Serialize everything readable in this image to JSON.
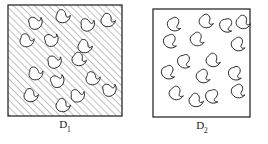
{
  "figure": {
    "type": "two-region-comparison-diagram",
    "background_color": "#ffffff",
    "stroke_color": "#1a1a1a",
    "hatch_color": "#8c8c8c",
    "bean_fill": "#ffffff",
    "bean_stroke": "#1a1a1a"
  },
  "panels": [
    {
      "id": "D1",
      "label_main": "D",
      "label_sub": "1",
      "box": {
        "x": 8,
        "y": 5,
        "width": 114,
        "height": 111
      },
      "label_pos": {
        "x": 65,
        "y": 125
      },
      "fill": "hatched",
      "hatch_angle_deg": 45,
      "hatch_spacing_px": 5,
      "shape_count": 16,
      "shapes": [
        {
          "cx": 36,
          "cy": 23,
          "r": 7.2,
          "rot": -20
        },
        {
          "cx": 63,
          "cy": 17,
          "r": 7.2,
          "rot": 15
        },
        {
          "cx": 88,
          "cy": 25,
          "r": 7.2,
          "rot": -10
        },
        {
          "cx": 108,
          "cy": 21,
          "r": 7.2,
          "rot": 25
        },
        {
          "cx": 27,
          "cy": 41,
          "r": 7.2,
          "rot": 10
        },
        {
          "cx": 52,
          "cy": 40,
          "r": 7.2,
          "rot": -25
        },
        {
          "cx": 85,
          "cy": 47,
          "r": 7.2,
          "rot": 20
        },
        {
          "cx": 55,
          "cy": 62,
          "r": 7.2,
          "rot": -15
        },
        {
          "cx": 79,
          "cy": 60,
          "r": 7.2,
          "rot": 30
        },
        {
          "cx": 36,
          "cy": 74,
          "r": 7.2,
          "rot": 5
        },
        {
          "cx": 58,
          "cy": 81,
          "r": 7.2,
          "rot": -30
        },
        {
          "cx": 93,
          "cy": 79,
          "r": 7.2,
          "rot": 12
        },
        {
          "cx": 110,
          "cy": 90,
          "r": 7.2,
          "rot": -20
        },
        {
          "cx": 31,
          "cy": 96,
          "r": 7.2,
          "rot": 18
        },
        {
          "cx": 78,
          "cy": 96,
          "r": 7.2,
          "rot": -8
        },
        {
          "cx": 63,
          "cy": 106,
          "r": 7.2,
          "rot": 22
        }
      ]
    },
    {
      "id": "D2",
      "label_main": "D",
      "label_sub": "2",
      "box": {
        "x": 153,
        "y": 9,
        "width": 97,
        "height": 108
      },
      "label_pos": {
        "x": 202,
        "y": 126
      },
      "fill": "plain",
      "shape_count": 16,
      "shapes": [
        {
          "cx": 174,
          "cy": 25,
          "r": 7.2,
          "rot": 55
        },
        {
          "cx": 206,
          "cy": 22,
          "r": 7.2,
          "rot": 40
        },
        {
          "cx": 226,
          "cy": 26,
          "r": 7.2,
          "rot": 70
        },
        {
          "cx": 243,
          "cy": 23,
          "r": 7.2,
          "rot": 35
        },
        {
          "cx": 170,
          "cy": 42,
          "r": 7.2,
          "rot": 60
        },
        {
          "cx": 197,
          "cy": 40,
          "r": 7.2,
          "rot": 45
        },
        {
          "cx": 238,
          "cy": 45,
          "r": 7.2,
          "rot": 50
        },
        {
          "cx": 184,
          "cy": 62,
          "r": 7.2,
          "rot": 65
        },
        {
          "cx": 213,
          "cy": 61,
          "r": 7.2,
          "rot": 38
        },
        {
          "cx": 168,
          "cy": 73,
          "r": 7.2,
          "rot": 58
        },
        {
          "cx": 203,
          "cy": 77,
          "r": 7.2,
          "rot": 48
        },
        {
          "cx": 235,
          "cy": 74,
          "r": 7.2,
          "rot": 62
        },
        {
          "cx": 176,
          "cy": 94,
          "r": 7.2,
          "rot": 42
        },
        {
          "cx": 212,
          "cy": 97,
          "r": 7.2,
          "rot": 68
        },
        {
          "cx": 238,
          "cy": 92,
          "r": 7.2,
          "rot": 52
        },
        {
          "cx": 196,
          "cy": 101,
          "r": 7.2,
          "rot": 30
        }
      ]
    }
  ]
}
